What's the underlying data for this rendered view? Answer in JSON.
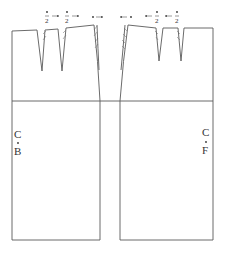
{
  "diagram": {
    "panels": [
      {
        "id": "back",
        "label_top": "C",
        "label_bottom": "B",
        "label_full": "C.B"
      },
      {
        "id": "front",
        "label_top": "C",
        "label_bottom": "F",
        "label_full": "C.F"
      }
    ],
    "dart_annotations": {
      "back": [
        {
          "symbol": "•",
          "denominator": "2",
          "direction": "right"
        },
        {
          "symbol": "•",
          "denominator": "2",
          "direction": "right"
        },
        {
          "symbol": "•",
          "denominator": "",
          "direction": "right"
        }
      ],
      "front": [
        {
          "symbol": "•",
          "denominator": "",
          "direction": "left"
        },
        {
          "symbol": "•",
          "denominator": "2",
          "direction": "left"
        },
        {
          "symbol": "•",
          "denominator": "2",
          "direction": "left"
        }
      ]
    },
    "line_color": "#5a5a5a",
    "background": "#ffffff"
  }
}
